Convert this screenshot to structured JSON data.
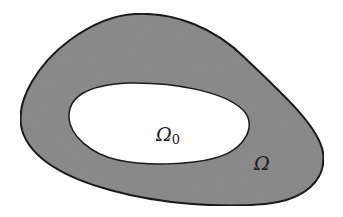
{
  "diagram": {
    "type": "set-region",
    "outer_region": {
      "label": "Ω",
      "fill": "#8c8c8c",
      "stroke": "#1a1a1a"
    },
    "inner_region": {
      "label_main": "Ω",
      "label_sub": "0",
      "fill": "#ffffff",
      "stroke": "#1a1a1a"
    },
    "background": "#ffffff"
  }
}
